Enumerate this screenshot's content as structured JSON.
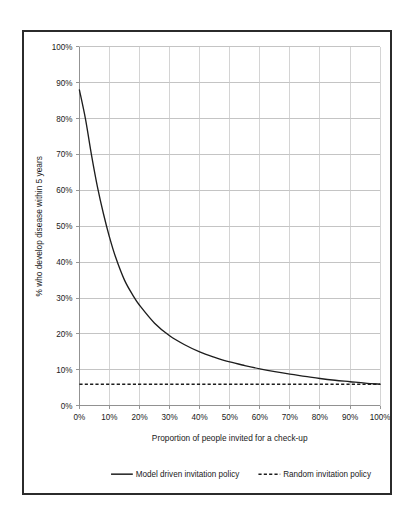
{
  "chart_data": {
    "type": "line",
    "title": "",
    "xlabel": "Proportion of people invited for a check-up",
    "ylabel": "% who develop disease within 5 years",
    "xlim": [
      0,
      100
    ],
    "ylim": [
      0,
      100
    ],
    "grid": true,
    "legend_position": "bottom",
    "x_tick_labels": [
      "0%",
      "10%",
      "20%",
      "30%",
      "40%",
      "50%",
      "60%",
      "70%",
      "80%",
      "90%",
      "100%"
    ],
    "y_tick_labels": [
      "0%",
      "10%",
      "20%",
      "30%",
      "40%",
      "50%",
      "60%",
      "70%",
      "80%",
      "90%",
      "100%"
    ],
    "x_ticks": [
      0,
      10,
      20,
      30,
      40,
      50,
      60,
      70,
      80,
      90,
      100
    ],
    "y_ticks": [
      0,
      10,
      20,
      30,
      40,
      50,
      60,
      70,
      80,
      90,
      100
    ],
    "x": [
      0,
      2,
      4,
      6,
      8,
      10,
      12,
      15,
      18,
      20,
      25,
      30,
      35,
      40,
      45,
      50,
      55,
      60,
      65,
      70,
      75,
      80,
      85,
      90,
      95,
      100
    ],
    "series": [
      {
        "name": "Model driven invitation policy",
        "style": "solid",
        "color": "#1d1d1d",
        "values": [
          88.0,
          80.0,
          70.0,
          61.0,
          53.5,
          47.0,
          41.5,
          35.0,
          30.5,
          28.0,
          23.0,
          19.5,
          17.0,
          15.0,
          13.5,
          12.2,
          11.2,
          10.3,
          9.5,
          8.8,
          8.2,
          7.6,
          7.1,
          6.7,
          6.3,
          6.0
        ]
      },
      {
        "name": "Random invitation policy",
        "style": "dashed",
        "color": "#1d1d1d",
        "values": [
          6.0,
          6.0,
          6.0,
          6.0,
          6.0,
          6.0,
          6.0,
          6.0,
          6.0,
          6.0,
          6.0,
          6.0,
          6.0,
          6.0,
          6.0,
          6.0,
          6.0,
          6.0,
          6.0,
          6.0,
          6.0,
          6.0,
          6.0,
          6.0,
          6.0,
          6.0
        ]
      }
    ],
    "legend": [
      {
        "label": "Model driven invitation policy",
        "style": "solid"
      },
      {
        "label": "Random invitation policy",
        "style": "dashed"
      }
    ]
  }
}
